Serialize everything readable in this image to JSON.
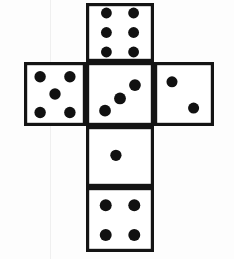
{
  "figure": {
    "title": "Cube net of a die",
    "description": "Unfolded cube net arranged as a cross of six square faces, each face marked with dice pips.",
    "canvas": {
      "width": 234,
      "height": 259
    },
    "colors": {
      "background": "#fdfdfd",
      "face_fill": "#ffffff",
      "outline": "#141414",
      "pip": "#111111",
      "scan_line": "#efefef"
    },
    "artifacts": [
      {
        "name": "scan-line",
        "type": "vertical-line",
        "x": 50,
        "color": "#efefef"
      }
    ]
  },
  "net": {
    "layout": "cross",
    "columns": 3,
    "rows": 4,
    "face_size": 68,
    "stroke_width": 3.2,
    "faces": [
      {
        "id": "face-top",
        "name": "top-face",
        "position": "top",
        "value": 6,
        "value_label": "6",
        "x": 86,
        "y": 3,
        "w": 68,
        "h": 59,
        "pips": [
          {
            "cx": 0.3,
            "cy": 0.17
          },
          {
            "cx": 0.7,
            "cy": 0.17
          },
          {
            "cx": 0.3,
            "cy": 0.5
          },
          {
            "cx": 0.7,
            "cy": 0.5
          },
          {
            "cx": 0.3,
            "cy": 0.83
          },
          {
            "cx": 0.7,
            "cy": 0.83
          }
        ]
      },
      {
        "id": "face-left",
        "name": "left-face",
        "position": "left",
        "value": 5,
        "value_label": "5",
        "x": 24,
        "y": 62,
        "w": 62,
        "h": 64,
        "pips": [
          {
            "cx": 0.26,
            "cy": 0.23
          },
          {
            "cx": 0.74,
            "cy": 0.23
          },
          {
            "cx": 0.5,
            "cy": 0.5
          },
          {
            "cx": 0.26,
            "cy": 0.79
          },
          {
            "cx": 0.74,
            "cy": 0.79
          }
        ]
      },
      {
        "id": "face-center",
        "name": "center-face",
        "position": "center",
        "value": 3,
        "value_label": "3",
        "x": 86,
        "y": 62,
        "w": 68,
        "h": 64,
        "pips": [
          {
            "cx": 0.28,
            "cy": 0.76
          },
          {
            "cx": 0.5,
            "cy": 0.57
          },
          {
            "cx": 0.72,
            "cy": 0.36
          }
        ]
      },
      {
        "id": "face-right",
        "name": "right-face",
        "position": "right",
        "value": 2,
        "value_label": "2",
        "x": 154,
        "y": 62,
        "w": 60,
        "h": 64,
        "pips": [
          {
            "cx": 0.3,
            "cy": 0.31
          },
          {
            "cx": 0.66,
            "cy": 0.72
          }
        ]
      },
      {
        "id": "face-lower-middle",
        "name": "lower-middle-face",
        "position": "below-center",
        "value": 1,
        "value_label": "1",
        "x": 86,
        "y": 126,
        "w": 68,
        "h": 61,
        "pips": [
          {
            "cx": 0.44,
            "cy": 0.48
          }
        ]
      },
      {
        "id": "face-bottom",
        "name": "bottom-face",
        "position": "bottom",
        "value": 4,
        "value_label": "4",
        "x": 86,
        "y": 187,
        "w": 68,
        "h": 65,
        "pips": [
          {
            "cx": 0.29,
            "cy": 0.28
          },
          {
            "cx": 0.71,
            "cy": 0.28
          },
          {
            "cx": 0.29,
            "cy": 0.74
          },
          {
            "cx": 0.71,
            "cy": 0.74
          }
        ]
      }
    ]
  }
}
